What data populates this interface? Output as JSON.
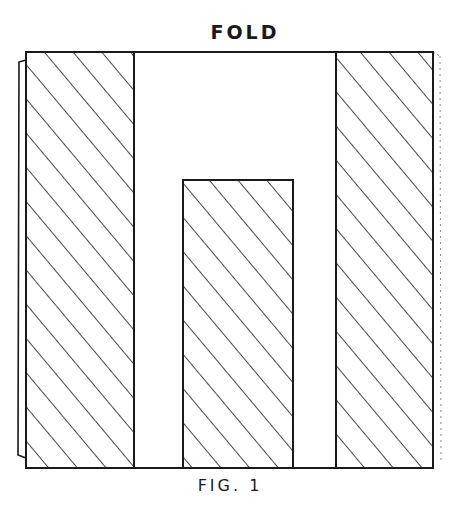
{
  "diagram": {
    "top_label": "FOLD",
    "caption": "FIG. 1",
    "line_color": "#1a1a1a",
    "background": "#ffffff",
    "regions": [
      {
        "name": "left-hatched-strip",
        "fill": "diagonal-hatch"
      },
      {
        "name": "left-blank-channel",
        "fill": "blank"
      },
      {
        "name": "center-hatched-block",
        "fill": "diagonal-hatch"
      },
      {
        "name": "right-blank-channel",
        "fill": "blank"
      },
      {
        "name": "right-hatched-strip",
        "fill": "diagonal-hatch"
      }
    ]
  }
}
